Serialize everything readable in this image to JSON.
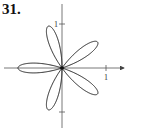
{
  "problem": {
    "number": "31."
  },
  "diagram": {
    "type": "polar-rose",
    "petals": 5,
    "equation_hint": "r = -cos(5θ)",
    "petal_angles_deg": [
      180,
      108,
      36,
      -36,
      -108
    ],
    "axes": {
      "x_tick_label": "1",
      "y_tick_label": "1"
    },
    "colors": {
      "curve": "#222222",
      "axes": "#444444"
    }
  }
}
